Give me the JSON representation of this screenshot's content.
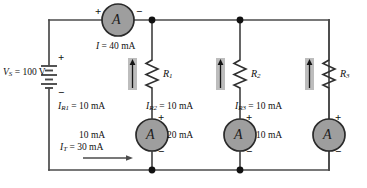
{
  "figure": {
    "type": "circuit-schematic",
    "colors": {
      "wire": "#4b4b4b",
      "meter_fill": "#9e9e9e",
      "meter_stroke": "#2a2a2a",
      "arrow_fill": "#b5b5b5",
      "text": "#111111"
    }
  },
  "source": {
    "label_var": "V",
    "label_sub": "S",
    "label_eq": " = 100 V",
    "full_label": "VS = 100 V",
    "plus": "+",
    "minus": "−",
    "value": "100 V"
  },
  "meters": {
    "main": {
      "name": "main-ammeter",
      "glyph": "A",
      "plus": "+",
      "minus": "−",
      "current_var": "I",
      "current_eq": " = 40 mA",
      "reading": "40 mA"
    },
    "branch1": {
      "name": "branch1-ammeter",
      "glyph": "A",
      "plus": "+",
      "minus": "−",
      "reading": "10 mA"
    },
    "branch2": {
      "name": "branch2-ammeter",
      "glyph": "A",
      "plus": "+",
      "minus": "−",
      "reading": "20 mA"
    },
    "branch3": {
      "name": "branch3-ammeter",
      "glyph": "A",
      "plus": "+",
      "minus": "−",
      "reading": "10 mA"
    }
  },
  "resistors": [
    {
      "var": "R",
      "sub": "1",
      "label": "R1"
    },
    {
      "var": "R",
      "sub": "2",
      "label": "R2"
    },
    {
      "var": "R",
      "sub": "3",
      "label": "R3"
    }
  ],
  "currents": {
    "r1": {
      "var": "I",
      "sub": "R1",
      "eq": " = 10 mA",
      "value": "10 mA"
    },
    "r2": {
      "var": "I",
      "sub": "R2",
      "eq": " = 10 mA",
      "value": "10 mA"
    },
    "r3": {
      "var": "I",
      "sub": "R3",
      "eq": " = 10 mA",
      "value": "10 mA"
    },
    "total": {
      "var": "I",
      "sub": "T",
      "eq": " = 30 mA",
      "value": "30 mA"
    }
  }
}
